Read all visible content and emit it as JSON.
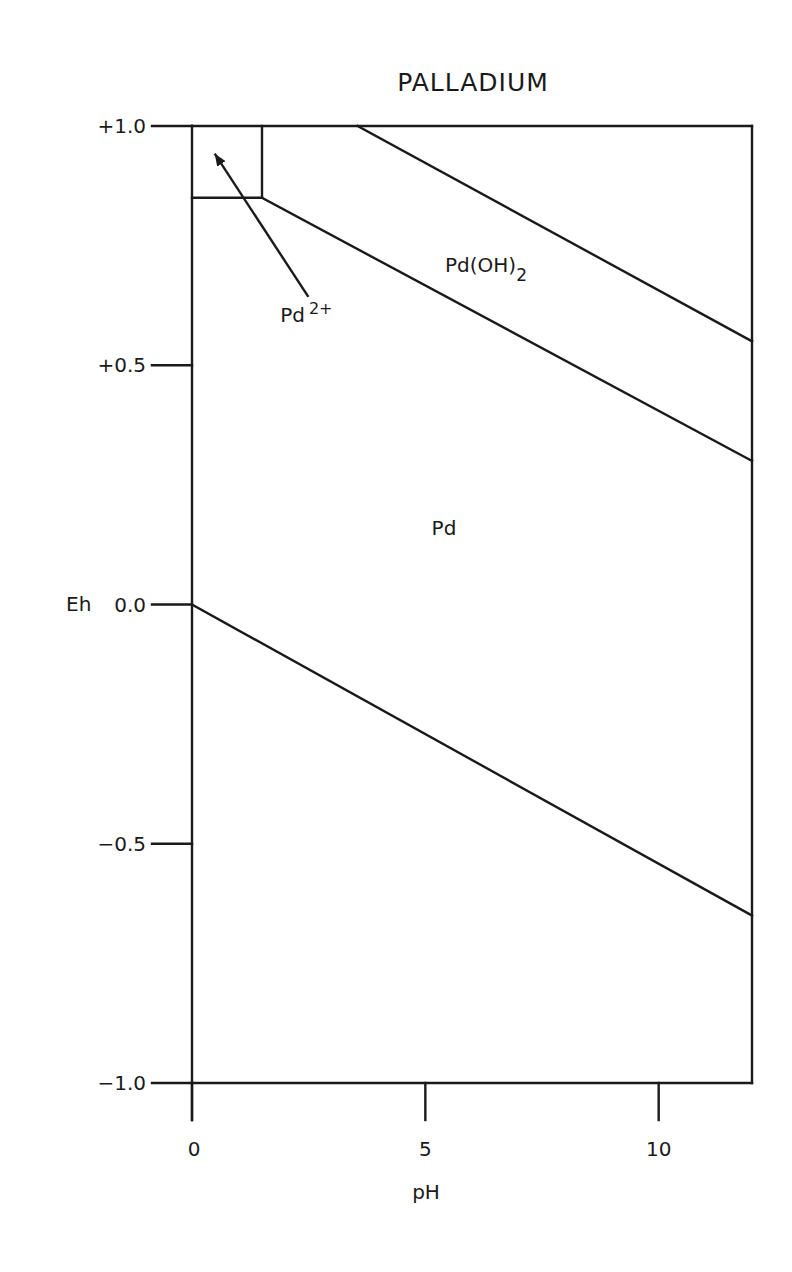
{
  "chart_data": {
    "type": "line",
    "subtype": "pourbaix-diagram",
    "title": "PALLADIUM",
    "xlabel": "pH",
    "ylabel": "Eh",
    "xlim": [
      0,
      12
    ],
    "ylim": [
      -1.0,
      1.0
    ],
    "grid": false,
    "x_ticks": [
      0,
      5,
      10
    ],
    "x_tick_labels": [
      "0",
      "5",
      "10"
    ],
    "y_ticks": [
      1.0,
      0.5,
      0.0,
      -0.5,
      -1.0
    ],
    "y_tick_labels": [
      "+1.0",
      "+0.5",
      "0.0",
      "−0.5",
      "−1.0"
    ],
    "series": [
      {
        "name": "Pd2+/Pd boundary (horizontal)",
        "points": [
          [
            0,
            0.85
          ],
          [
            1.5,
            0.85
          ]
        ]
      },
      {
        "name": "Pd2+/Pd(OH)2 boundary (vertical)",
        "points": [
          [
            1.5,
            0.85
          ],
          [
            1.5,
            1.0
          ]
        ]
      },
      {
        "name": "Pd(OH)2/Pd boundary",
        "points": [
          [
            1.5,
            0.85
          ],
          [
            12,
            0.3
          ]
        ]
      },
      {
        "name": "upper water stability line",
        "points": [
          [
            3.55,
            1.0
          ],
          [
            12,
            0.55
          ]
        ]
      },
      {
        "name": "lower water stability line",
        "points": [
          [
            0,
            0.0
          ],
          [
            12,
            -0.65
          ]
        ]
      }
    ],
    "region_labels": [
      {
        "text": "Pd(OH)",
        "sub": "2",
        "x": 6.3,
        "y": 0.695
      },
      {
        "text": "Pd",
        "sup": "2+",
        "x": 2.45,
        "y": 0.59
      },
      {
        "text": "Pd",
        "x": 5.4,
        "y": 0.145
      }
    ],
    "annotations": [
      {
        "type": "arrow",
        "from": [
          2.48,
          0.645
        ],
        "to": [
          0.5,
          0.94
        ],
        "label": "Pd2+"
      }
    ]
  }
}
